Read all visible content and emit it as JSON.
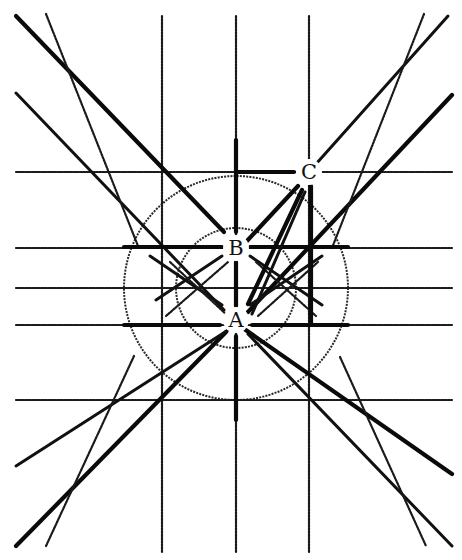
{
  "diagram": {
    "title": "",
    "points": [
      {
        "label": "A",
        "x": 236,
        "y": 320
      },
      {
        "label": "B",
        "x": 236,
        "y": 248
      },
      {
        "label": "C",
        "x": 309,
        "y": 172
      }
    ],
    "vertical_lines": [
      {
        "x": 162,
        "y1": 16,
        "y2": 552
      },
      {
        "x": 236,
        "y1": 16,
        "y2": 552
      },
      {
        "x": 309,
        "y1": 16,
        "y2": 552
      }
    ],
    "horizontal_lines": [
      {
        "y": 172,
        "x1": 16,
        "x2": 452
      },
      {
        "y": 248,
        "x1": 16,
        "x2": 452
      },
      {
        "y": 288,
        "x1": 16,
        "x2": 452
      },
      {
        "y": 325,
        "x1": 16,
        "x2": 452
      },
      {
        "y": 400,
        "x1": 16,
        "x2": 452
      }
    ],
    "thick_segments": [
      {
        "x1": 124,
        "y1": 247,
        "x2": 222,
        "y2": 247
      },
      {
        "x1": 250,
        "y1": 247,
        "x2": 348,
        "y2": 247
      },
      {
        "x1": 124,
        "y1": 325,
        "x2": 220,
        "y2": 325
      },
      {
        "x1": 252,
        "y1": 325,
        "x2": 348,
        "y2": 325
      },
      {
        "x1": 236,
        "y1": 140,
        "x2": 236,
        "y2": 232
      },
      {
        "x1": 236,
        "y1": 262,
        "x2": 236,
        "y2": 306
      },
      {
        "x1": 236,
        "y1": 336,
        "x2": 236,
        "y2": 420
      },
      {
        "x1": 237,
        "y1": 172,
        "x2": 294,
        "y2": 172
      },
      {
        "x1": 311,
        "y1": 186,
        "x2": 311,
        "y2": 325
      }
    ],
    "diagonals": [
      {
        "x1": 16,
        "y1": 16,
        "x2": 224,
        "y2": 232,
        "w": "thick"
      },
      {
        "x1": 16,
        "y1": 93,
        "x2": 224,
        "y2": 310,
        "w": "med"
      },
      {
        "x1": 46,
        "y1": 14,
        "x2": 138,
        "y2": 246,
        "w": "thin"
      },
      {
        "x1": 448,
        "y1": 16,
        "x2": 316,
        "y2": 164,
        "w": "med"
      },
      {
        "x1": 452,
        "y1": 95,
        "x2": 248,
        "y2": 312,
        "w": "thick"
      },
      {
        "x1": 424,
        "y1": 14,
        "x2": 332,
        "y2": 248,
        "w": "thin"
      },
      {
        "x1": 16,
        "y1": 546,
        "x2": 226,
        "y2": 332,
        "w": "thick"
      },
      {
        "x1": 16,
        "y1": 466,
        "x2": 236,
        "y2": 325,
        "w": "med"
      },
      {
        "x1": 46,
        "y1": 546,
        "x2": 134,
        "y2": 356,
        "w": "thin"
      },
      {
        "x1": 248,
        "y1": 334,
        "x2": 452,
        "y2": 546,
        "w": "med"
      },
      {
        "x1": 240,
        "y1": 326,
        "x2": 452,
        "y2": 474,
        "w": "thick"
      },
      {
        "x1": 340,
        "y1": 357,
        "x2": 426,
        "y2": 546,
        "w": "thin"
      },
      {
        "x1": 216,
        "y1": 262,
        "x2": 16,
        "y2": 93,
        "w": "none"
      }
    ],
    "cross_lines": [
      {
        "x1": 150,
        "y1": 256,
        "x2": 222,
        "y2": 305,
        "w": "med"
      },
      {
        "x1": 156,
        "y1": 300,
        "x2": 222,
        "y2": 256,
        "w": "med"
      },
      {
        "x1": 170,
        "y1": 262,
        "x2": 228,
        "y2": 316,
        "w": "thin"
      },
      {
        "x1": 166,
        "y1": 316,
        "x2": 228,
        "y2": 262,
        "w": "thin"
      },
      {
        "x1": 250,
        "y1": 305,
        "x2": 322,
        "y2": 256,
        "w": "med"
      },
      {
        "x1": 250,
        "y1": 256,
        "x2": 322,
        "y2": 305,
        "w": "med"
      },
      {
        "x1": 258,
        "y1": 316,
        "x2": 318,
        "y2": 262,
        "w": "thin"
      },
      {
        "x1": 256,
        "y1": 262,
        "x2": 316,
        "y2": 316,
        "w": "thin"
      }
    ],
    "ac_lines": [
      {
        "x1": 248,
        "y1": 304,
        "x2": 302,
        "y2": 190,
        "w": "thick"
      },
      {
        "x1": 246,
        "y1": 242,
        "x2": 298,
        "y2": 186,
        "w": "thick"
      },
      {
        "x1": 252,
        "y1": 314,
        "x2": 305,
        "y2": 192,
        "w": "med"
      }
    ],
    "circles": [
      {
        "cx": 236,
        "cy": 288,
        "r": 112
      },
      {
        "cx": 236,
        "cy": 288,
        "r": 60
      }
    ]
  }
}
